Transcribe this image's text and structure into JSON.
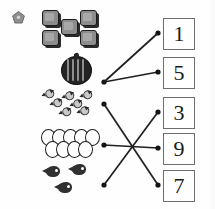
{
  "worksheet": {
    "title": "Count and match worksheet",
    "type": "matching-exercise",
    "background_color": "#fefefe",
    "line_color": "#1f1f1f",
    "box_border_color": "#6e6e6e"
  },
  "corner_icon": {
    "name": "pentagon-icon",
    "fill": "#8f8f8f",
    "stroke": "#6b6b6b"
  },
  "object_groups": [
    {
      "id": "squares",
      "label": "gray screens",
      "count": 5,
      "item_name": "square-screen",
      "fill": "#8d8d8d",
      "stroke": "#1b1b1b"
    },
    {
      "id": "watermelon",
      "label": "watermelon",
      "count": 1,
      "item_name": "watermelon",
      "fill": "#242424",
      "stroke": "#111111"
    },
    {
      "id": "candies",
      "label": "wrapped candies",
      "count": 7,
      "item_name": "candy",
      "fill": "#c9c9c9",
      "stroke": "#2b2b2b"
    },
    {
      "id": "eggs",
      "label": "eggs",
      "count": 9,
      "item_name": "egg",
      "fill": "#ffffff",
      "stroke": "#1c1c1c"
    },
    {
      "id": "fish",
      "label": "fish",
      "count": 3,
      "item_name": "fish",
      "fill": "#303030",
      "stroke": "#303030"
    }
  ],
  "number_boxes": [
    {
      "id": "box-1",
      "value": "1"
    },
    {
      "id": "box-2",
      "value": "5"
    },
    {
      "id": "box-3",
      "value": "3"
    },
    {
      "id": "box-4",
      "value": "9"
    },
    {
      "id": "box-5",
      "value": "7"
    }
  ],
  "connections": [
    {
      "from": "squares",
      "to": "box-2",
      "from_point": [
        104,
        82
      ],
      "to_point": [
        158,
        72
      ]
    },
    {
      "from": "watermelon",
      "to": "box-1",
      "from_point": [
        104,
        82
      ],
      "to_point": [
        158,
        33
      ]
    },
    {
      "from": "candies",
      "to": "box-5",
      "from_point": [
        104,
        104
      ],
      "to_point": [
        158,
        185
      ]
    },
    {
      "from": "eggs",
      "to": "box-4",
      "from_point": [
        104,
        145
      ],
      "to_point": [
        158,
        148
      ]
    },
    {
      "from": "fish",
      "to": "box-3",
      "from_point": [
        104,
        185
      ],
      "to_point": [
        158,
        112
      ]
    }
  ]
}
